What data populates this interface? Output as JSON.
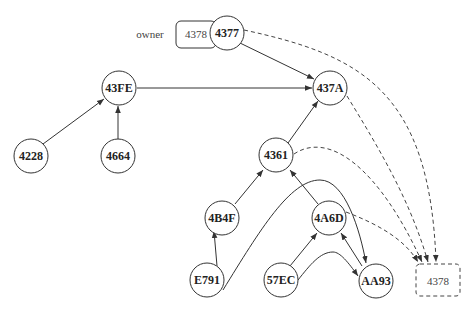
{
  "diagram": {
    "owner_label": "owner",
    "owner_box": "4378",
    "target_box": "4378",
    "nodes": [
      {
        "id": "4377",
        "label": "4377"
      },
      {
        "id": "43FE",
        "label": "43FE"
      },
      {
        "id": "437A",
        "label": "437A"
      },
      {
        "id": "4228",
        "label": "4228"
      },
      {
        "id": "4664",
        "label": "4664"
      },
      {
        "id": "4361",
        "label": "4361"
      },
      {
        "id": "4B4F",
        "label": "4B4F"
      },
      {
        "id": "4A6D",
        "label": "4A6D"
      },
      {
        "id": "E791",
        "label": "E791"
      },
      {
        "id": "57EC",
        "label": "57EC"
      },
      {
        "id": "AA93",
        "label": "AA93"
      }
    ],
    "edges": [
      {
        "from": "4377",
        "to": "437A",
        "style": "solid"
      },
      {
        "from": "43FE",
        "to": "437A",
        "style": "solid"
      },
      {
        "from": "4228",
        "to": "43FE",
        "style": "solid"
      },
      {
        "from": "4664",
        "to": "43FE",
        "style": "solid"
      },
      {
        "from": "4361",
        "to": "437A",
        "style": "solid"
      },
      {
        "from": "4B4F",
        "to": "4361",
        "style": "solid"
      },
      {
        "from": "4A6D",
        "to": "4361",
        "style": "solid"
      },
      {
        "from": "E791",
        "to": "4B4F",
        "style": "solid"
      },
      {
        "from": "E791",
        "to": "AA93",
        "style": "solid"
      },
      {
        "from": "57EC",
        "to": "4A6D",
        "style": "solid"
      },
      {
        "from": "57EC",
        "to": "AA93",
        "style": "solid"
      },
      {
        "from": "AA93",
        "to": "4A6D",
        "style": "solid"
      },
      {
        "from": "4377",
        "to": "4378",
        "style": "dashed"
      },
      {
        "from": "437A",
        "to": "4378",
        "style": "dashed"
      },
      {
        "from": "4361",
        "to": "4378",
        "style": "dashed"
      },
      {
        "from": "4A6D",
        "to": "4378",
        "style": "dashed"
      }
    ]
  }
}
